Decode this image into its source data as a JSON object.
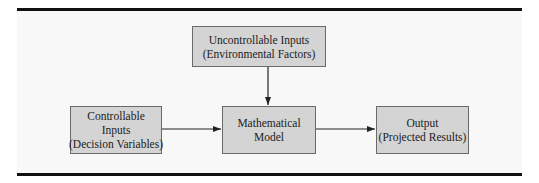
{
  "diagram": {
    "type": "flowchart",
    "nodes": [
      {
        "id": "uncontrollable",
        "lines": [
          "Uncontrollable Inputs",
          "(Environmental Factors)"
        ]
      },
      {
        "id": "controllable",
        "lines": [
          "Controllable",
          "Inputs",
          "(Decision Variables)"
        ]
      },
      {
        "id": "model",
        "lines": [
          "Mathematical",
          "Model"
        ]
      },
      {
        "id": "output",
        "lines": [
          "Output",
          "(Projected Results)"
        ]
      }
    ],
    "edges": [
      {
        "from": "uncontrollable",
        "to": "model"
      },
      {
        "from": "controllable",
        "to": "model"
      },
      {
        "from": "model",
        "to": "output"
      }
    ],
    "colors": {
      "box_fill": "#d4d4d4",
      "box_border": "#6a6a6a",
      "rule": "#111111",
      "arrow": "#222222"
    }
  }
}
